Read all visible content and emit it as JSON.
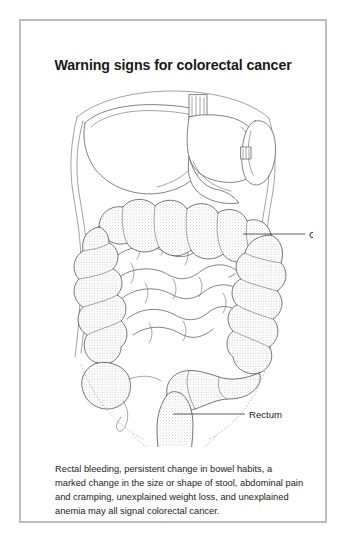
{
  "card": {
    "border_color": "#bdbdbd",
    "background": "#ffffff"
  },
  "title": "Warning signs for colorectal cancer",
  "figure": {
    "alt_name": "abdominal-anatomy-illustration",
    "labels": [
      {
        "id": "colon",
        "text": "Colon"
      },
      {
        "id": "rectum",
        "text": "Rectum"
      }
    ],
    "organs": [
      "liver",
      "stomach",
      "spleen",
      "ascending-colon",
      "transverse-colon",
      "descending-colon",
      "sigmoid-colon",
      "cecum",
      "appendix",
      "rectum",
      "small-intestine"
    ],
    "colors": {
      "organ_stroke": "#5a5a5a",
      "colon_stroke": "#4a4a4a",
      "body_outline": "#8a8a8a",
      "pelvis_dotted": "#b0b0b0",
      "leader_line": "#2a2a2a",
      "colon_fill": "#ffffff"
    }
  },
  "caption": "Rectal bleeding, persistent change in bowel habits, a marked change in the size or shape of stool, abdominal pain and cramping, unexplained weight loss, and unexplained anemia may all signal colorectal cancer."
}
